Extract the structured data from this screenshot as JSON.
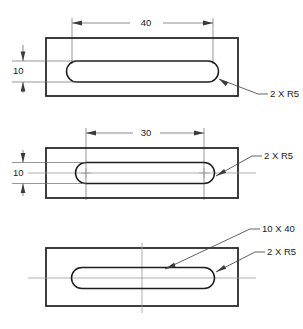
{
  "drawing": {
    "title": "Slot dimensioning - three alternative methods",
    "units_implied": "mm",
    "views": [
      {
        "id": "top-view",
        "name": "slot-overall-length-method",
        "dimensions": [
          {
            "name": "slot-overall-length",
            "value": "40",
            "orientation": "horizontal",
            "placement": "above"
          },
          {
            "name": "slot-width",
            "value": "10",
            "orientation": "vertical",
            "placement": "left"
          }
        ],
        "notes": [
          {
            "name": "radius-note",
            "text": "2 X R5"
          }
        ],
        "centerlines": []
      },
      {
        "id": "middle-view",
        "name": "center-to-center-method",
        "dimensions": [
          {
            "name": "slot-center-distance",
            "value": "30",
            "orientation": "horizontal",
            "placement": "above"
          },
          {
            "name": "slot-width",
            "value": "10",
            "orientation": "vertical",
            "placement": "left"
          }
        ],
        "notes": [
          {
            "name": "radius-note",
            "text": "2 X R5"
          }
        ],
        "centerlines": [
          "horizontal",
          "center-marks-at-arc-centers"
        ]
      },
      {
        "id": "bottom-view",
        "name": "note-callout-method",
        "dimensions": [],
        "notes": [
          {
            "name": "slot-size-note",
            "text": "10 X 40"
          },
          {
            "name": "radius-note",
            "text": "2 X R5"
          }
        ],
        "centerlines": [
          "horizontal",
          "vertical"
        ]
      }
    ],
    "colors": {
      "object_line": "#1d1d1d",
      "thin_line": "#5a5a5a",
      "center_line": "#9a9a9a",
      "background": "#ffffff",
      "text": "#1a1a1a"
    }
  }
}
